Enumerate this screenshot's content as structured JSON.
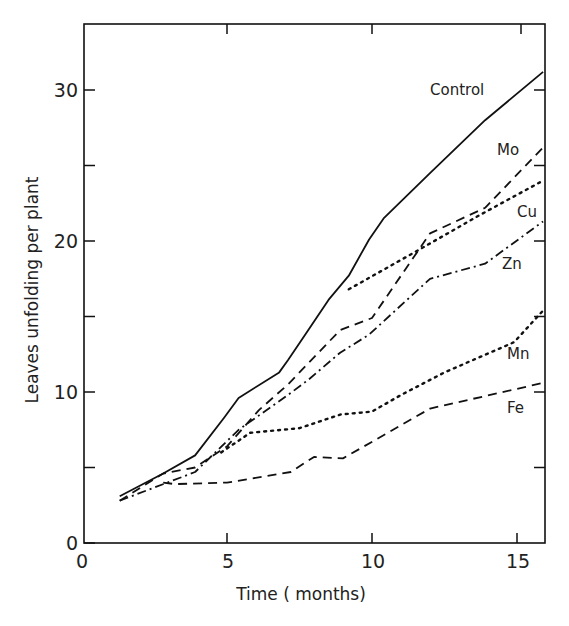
{
  "chart_data": {
    "type": "line",
    "title": "",
    "xlabel": "Time ( months)",
    "ylabel": "Leaves unfolding per plant",
    "xlim": [
      0,
      15.9
    ],
    "ylim": [
      0,
      34.3
    ],
    "x_ticks": [
      0,
      5,
      10,
      15
    ],
    "x_tick_labels": [
      "0",
      "5",
      "10",
      "15"
    ],
    "y_ticks": [
      0,
      5,
      10,
      15,
      20,
      25,
      30
    ],
    "y_tick_labels": [
      "0",
      "",
      "10",
      "",
      "20",
      "",
      "30"
    ],
    "grid": false,
    "legend": "inline labels at right end of each line",
    "series": [
      {
        "name": "Control",
        "style": "solid",
        "x": [
          1.3,
          2.8,
          3.9,
          4.9,
          5.4,
          6.8,
          7.1,
          7.7,
          8.5,
          9.2,
          9.9,
          10.4,
          12.0,
          13.9,
          15.9
        ],
        "y": [
          3.1,
          4.6,
          5.8,
          8.3,
          9.6,
          11.3,
          12.1,
          13.8,
          16.1,
          17.7,
          20.1,
          21.5,
          24.5,
          28.0,
          31.2
        ]
      },
      {
        "name": "Mo",
        "style": "dashed",
        "x": [
          1.3,
          2.8,
          3.9,
          5.0,
          6.1,
          7.1,
          8.9,
          10.0,
          12.0,
          13.9,
          15.9
        ],
        "y": [
          2.8,
          4.6,
          5.0,
          6.4,
          8.8,
          10.5,
          14.1,
          14.9,
          20.5,
          22.2,
          26.2
        ]
      },
      {
        "name": "Cu",
        "style": "dotted",
        "x": [
          9.2,
          11.6,
          13.7,
          15.9
        ],
        "y": [
          16.8,
          19.4,
          21.7,
          24.0
        ]
      },
      {
        "name": "Zn",
        "style": "dash-dot",
        "x": [
          1.3,
          3.9,
          5.4,
          7.1,
          7.8,
          8.9,
          9.9,
          12.0,
          13.9,
          15.9
        ],
        "y": [
          2.8,
          4.7,
          7.5,
          9.8,
          10.8,
          12.6,
          13.8,
          17.5,
          18.5,
          21.3
        ]
      },
      {
        "name": "Mn",
        "style": "dotted",
        "x": [
          4.8,
          5.8,
          7.5,
          8.9,
          10.0,
          11.0,
          12.5,
          14.9,
          15.9
        ],
        "y": [
          6.0,
          7.3,
          7.6,
          8.5,
          8.7,
          9.8,
          11.3,
          13.3,
          15.4
        ]
      },
      {
        "name": "Fe",
        "style": "dashed",
        "x": [
          2.8,
          3.2,
          5.0,
          7.2,
          8.0,
          9.0,
          11.0,
          12.0,
          15.9
        ],
        "y": [
          4.0,
          3.9,
          4.0,
          4.7,
          5.7,
          5.6,
          7.8,
          8.9,
          10.6
        ]
      }
    ]
  },
  "labels": {
    "control": "Control",
    "mo": "Mo",
    "cu": "Cu",
    "zn": "Zn",
    "mn": "Mn",
    "fe": "Fe",
    "xlabel": "Time ( months)",
    "ylabel": "Leaves unfolding per plant",
    "xt0": "0",
    "xt5": "5",
    "xt10": "10",
    "xt15": "15",
    "yt0": "0",
    "yt10": "10",
    "yt20": "20",
    "yt30": "30"
  }
}
